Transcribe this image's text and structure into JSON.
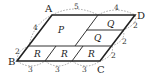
{
  "diagram": {
    "type": "parallelogram-partition",
    "vertices": [
      {
        "id": "A",
        "label": "A"
      },
      {
        "id": "B",
        "label": "B"
      },
      {
        "id": "C",
        "label": "C"
      },
      {
        "id": "D",
        "label": "D"
      }
    ],
    "regions": [
      {
        "id": "P",
        "label": "P"
      },
      {
        "id": "Q1",
        "label": "Q"
      },
      {
        "id": "Q2",
        "label": "Q"
      },
      {
        "id": "R1",
        "label": "R"
      },
      {
        "id": "R2",
        "label": "R"
      },
      {
        "id": "R3",
        "label": "R"
      }
    ],
    "measurements": {
      "top_AD": [
        "5",
        "4"
      ],
      "left_AB": [
        "4",
        "2"
      ],
      "bottom_BC": [
        "3",
        "3",
        "3"
      ],
      "right_DC": [
        "2",
        "2",
        "2"
      ]
    }
  }
}
